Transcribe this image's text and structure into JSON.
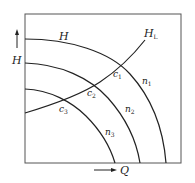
{
  "diagram": {
    "type": "pump-characteristic-curves",
    "axes": {
      "x_label": "Q",
      "y_label": "H"
    },
    "curves": [
      {
        "id": "H",
        "label": "H",
        "speed_label": "n",
        "speed_sub": "1"
      },
      {
        "id": "n2",
        "label": "",
        "speed_label": "n",
        "speed_sub": "2"
      },
      {
        "id": "n3",
        "label": "",
        "speed_label": "n",
        "speed_sub": "3"
      }
    ],
    "system_curve": {
      "label": "H",
      "label_sub": "L"
    },
    "intersections": [
      {
        "label": "c",
        "sub": "1"
      },
      {
        "label": "c",
        "sub": "2"
      },
      {
        "label": "c",
        "sub": "3"
      }
    ]
  }
}
